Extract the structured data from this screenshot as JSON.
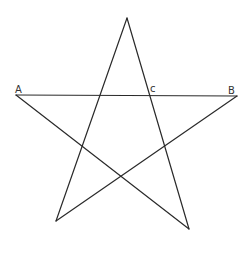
{
  "diagram": {
    "type": "pentagram",
    "stroke_color": "#2a2a2a",
    "background": "#ffffff",
    "vertices": {
      "top": [
        127,
        18
      ],
      "A": [
        16,
        95
      ],
      "B": [
        237,
        96
      ],
      "bottom_left": [
        56,
        221
      ],
      "bottom_right": [
        189,
        229
      ]
    },
    "labels": [
      {
        "id": "A",
        "text": "A",
        "x": 15,
        "y": 93
      },
      {
        "id": "C",
        "text": "c",
        "x": 150,
        "y": 92
      },
      {
        "id": "B",
        "text": "B",
        "x": 228,
        "y": 94
      }
    ],
    "edges": [
      [
        "A",
        "B"
      ],
      [
        "A",
        "bottom_right"
      ],
      [
        "B",
        "bottom_left"
      ],
      [
        "top",
        "bottom_left"
      ],
      [
        "top",
        "bottom_right"
      ]
    ]
  }
}
